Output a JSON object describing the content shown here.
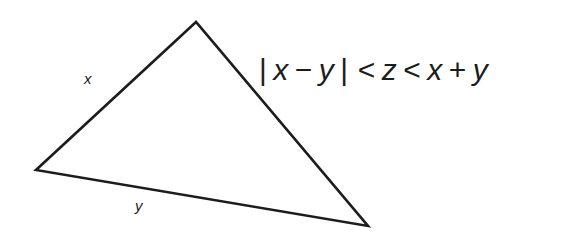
{
  "figure": {
    "background_color": "#ffffff",
    "stroke_color": "#1c1c1c",
    "text_color": "#1c1c1c",
    "stroke_width": 2.6,
    "triangle": {
      "name": "scalene-triangle",
      "vertices": [
        {
          "name": "apex",
          "x": 196,
          "y": 22
        },
        {
          "name": "bottom-left",
          "x": 36,
          "y": 170
        },
        {
          "name": "bottom-right",
          "x": 368,
          "y": 226
        }
      ],
      "path": "M 196,22 L 36,170 L 368,226 Z"
    },
    "side_labels": [
      {
        "id": "x",
        "text": "x",
        "x": 90,
        "y": 80,
        "side": "left-edge"
      },
      {
        "id": "y",
        "text": "y",
        "x": 141,
        "y": 207,
        "side": "bottom-edge"
      }
    ],
    "formula": {
      "plain": "| x − y | < z < x + y",
      "tokens": [
        {
          "type": "bar",
          "text": "|"
        },
        {
          "type": "var",
          "text": "x"
        },
        {
          "type": "op",
          "text": "−"
        },
        {
          "type": "var",
          "text": "y"
        },
        {
          "type": "bar",
          "text": "|"
        },
        {
          "type": "op",
          "text": "<"
        },
        {
          "type": "var",
          "text": "z"
        },
        {
          "type": "op",
          "text": "<"
        },
        {
          "type": "var",
          "text": "x"
        },
        {
          "type": "op",
          "text": "+"
        },
        {
          "type": "var",
          "text": "y"
        }
      ],
      "parts": {
        "bar_open": "|",
        "x1": "x",
        "minus": "−",
        "y1": "y",
        "bar_close": "|",
        "lt1": "<",
        "z": "z",
        "lt2": "<",
        "x2": "x",
        "plus": "+",
        "y2": "y"
      },
      "font_size_px": 30,
      "position": {
        "x": 261,
        "y": 85
      }
    }
  }
}
